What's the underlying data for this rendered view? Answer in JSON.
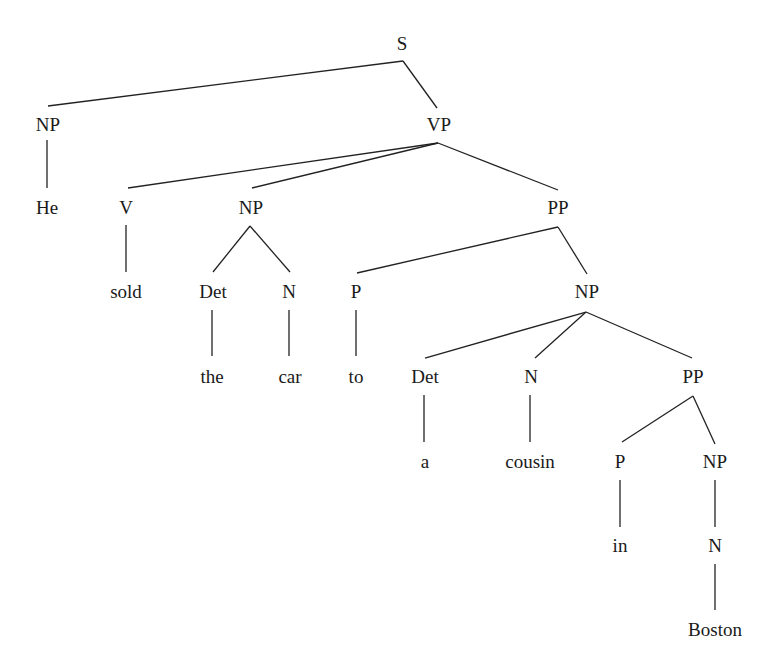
{
  "diagram": {
    "type": "syntax-tree",
    "sentence": "He sold the car to a cousin in Boston",
    "nodes": [
      {
        "id": "s",
        "label": "S",
        "x": 402,
        "y": 43
      },
      {
        "id": "np1",
        "label": "NP",
        "x": 48,
        "y": 124
      },
      {
        "id": "vp",
        "label": "VP",
        "x": 439,
        "y": 124
      },
      {
        "id": "he",
        "label": "He",
        "x": 47,
        "y": 207
      },
      {
        "id": "v",
        "label": "V",
        "x": 126,
        "y": 207
      },
      {
        "id": "np2",
        "label": "NP",
        "x": 251,
        "y": 207
      },
      {
        "id": "pp1",
        "label": "PP",
        "x": 558,
        "y": 207
      },
      {
        "id": "sold",
        "label": "sold",
        "x": 126,
        "y": 291
      },
      {
        "id": "det1",
        "label": "Det",
        "x": 213,
        "y": 291
      },
      {
        "id": "n1",
        "label": "N",
        "x": 289,
        "y": 291
      },
      {
        "id": "p1",
        "label": "P",
        "x": 356,
        "y": 291
      },
      {
        "id": "np3",
        "label": "NP",
        "x": 587,
        "y": 291
      },
      {
        "id": "the",
        "label": "the",
        "x": 212,
        "y": 376
      },
      {
        "id": "car",
        "label": "car",
        "x": 290,
        "y": 376
      },
      {
        "id": "to",
        "label": "to",
        "x": 356,
        "y": 376
      },
      {
        "id": "det2",
        "label": "Det",
        "x": 425,
        "y": 376
      },
      {
        "id": "n2",
        "label": "N",
        "x": 531,
        "y": 376
      },
      {
        "id": "pp2",
        "label": "PP",
        "x": 693,
        "y": 376
      },
      {
        "id": "a",
        "label": "a",
        "x": 425,
        "y": 461
      },
      {
        "id": "cousin",
        "label": "cousin",
        "x": 530,
        "y": 461
      },
      {
        "id": "p2",
        "label": "P",
        "x": 620,
        "y": 461
      },
      {
        "id": "np4",
        "label": "NP",
        "x": 715,
        "y": 461
      },
      {
        "id": "in",
        "label": "in",
        "x": 620,
        "y": 545
      },
      {
        "id": "n3",
        "label": "N",
        "x": 715,
        "y": 545
      },
      {
        "id": "boston",
        "label": "Boston",
        "x": 715,
        "y": 629
      }
    ],
    "edges": [
      {
        "from": "s",
        "to": "np1",
        "x1": 403,
        "y1": 61,
        "x2": 48,
        "y2": 106
      },
      {
        "from": "s",
        "to": "vp",
        "x1": 403,
        "y1": 61,
        "x2": 437,
        "y2": 108
      },
      {
        "from": "np1",
        "to": "he",
        "x1": 47,
        "y1": 140,
        "x2": 47,
        "y2": 188
      },
      {
        "from": "vp",
        "to": "v",
        "x1": 438,
        "y1": 143,
        "x2": 128,
        "y2": 188
      },
      {
        "from": "vp",
        "to": "np2",
        "x1": 438,
        "y1": 143,
        "x2": 252,
        "y2": 188
      },
      {
        "from": "vp",
        "to": "pp1",
        "x1": 438,
        "y1": 143,
        "x2": 558,
        "y2": 190
      },
      {
        "from": "v",
        "to": "sold",
        "x1": 126,
        "y1": 225,
        "x2": 126,
        "y2": 272
      },
      {
        "from": "np2",
        "to": "det1",
        "x1": 250,
        "y1": 226,
        "x2": 213,
        "y2": 272
      },
      {
        "from": "np2",
        "to": "n1",
        "x1": 250,
        "y1": 226,
        "x2": 290,
        "y2": 272
      },
      {
        "from": "det1",
        "to": "the",
        "x1": 212,
        "y1": 310,
        "x2": 212,
        "y2": 356
      },
      {
        "from": "n1",
        "to": "car",
        "x1": 289,
        "y1": 310,
        "x2": 289,
        "y2": 356
      },
      {
        "from": "pp1",
        "to": "p1",
        "x1": 558,
        "y1": 227,
        "x2": 357,
        "y2": 273
      },
      {
        "from": "pp1",
        "to": "np3",
        "x1": 558,
        "y1": 227,
        "x2": 587,
        "y2": 274
      },
      {
        "from": "p1",
        "to": "to",
        "x1": 356,
        "y1": 310,
        "x2": 356,
        "y2": 356
      },
      {
        "from": "np3",
        "to": "det2",
        "x1": 586,
        "y1": 312,
        "x2": 425,
        "y2": 358
      },
      {
        "from": "np3",
        "to": "n2",
        "x1": 586,
        "y1": 312,
        "x2": 535,
        "y2": 358
      },
      {
        "from": "np3",
        "to": "pp2",
        "x1": 586,
        "y1": 312,
        "x2": 692,
        "y2": 358
      },
      {
        "from": "det2",
        "to": "a",
        "x1": 424,
        "y1": 395,
        "x2": 424,
        "y2": 442
      },
      {
        "from": "n2",
        "to": "cousin",
        "x1": 530,
        "y1": 395,
        "x2": 530,
        "y2": 442
      },
      {
        "from": "pp2",
        "to": "p2",
        "x1": 693,
        "y1": 396,
        "x2": 622,
        "y2": 442
      },
      {
        "from": "pp2",
        "to": "np4",
        "x1": 693,
        "y1": 396,
        "x2": 715,
        "y2": 444
      },
      {
        "from": "p2",
        "to": "in",
        "x1": 620,
        "y1": 480,
        "x2": 620,
        "y2": 527
      },
      {
        "from": "np4",
        "to": "n3",
        "x1": 715,
        "y1": 480,
        "x2": 715,
        "y2": 527
      },
      {
        "from": "n3",
        "to": "boston",
        "x1": 715,
        "y1": 564,
        "x2": 715,
        "y2": 610
      }
    ]
  }
}
